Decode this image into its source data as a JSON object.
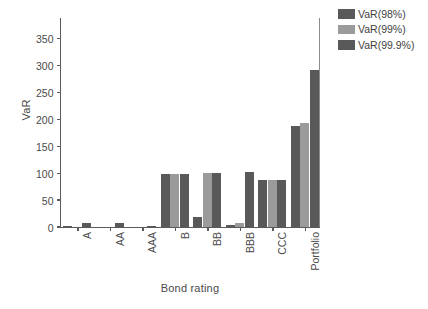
{
  "chart_data": {
    "type": "bar",
    "title": "",
    "xlabel": "Bond rating",
    "ylabel": "VaR",
    "categories": [
      "A",
      "AA",
      "AAA",
      "B",
      "BB",
      "BBB",
      "CCC",
      "Portfolio"
    ],
    "ylim": [
      0,
      390
    ],
    "yticks": [
      0,
      50,
      100,
      150,
      200,
      250,
      300,
      350
    ],
    "grid": false,
    "legend_position": "top-right-outside",
    "series": [
      {
        "name": "VaR(98%)",
        "color": "#595959",
        "values": [
          2,
          0,
          0,
          99,
          18,
          4,
          87,
          188
        ]
      },
      {
        "name": "VaR(99%)",
        "color": "#9b9b9b",
        "values": [
          0,
          0,
          0,
          99,
          100,
          7,
          87,
          194
        ]
      },
      {
        "name": "VaR(99.9%)",
        "color": "#595959",
        "values": [
          8,
          8,
          2,
          99,
          100,
          102,
          87,
          291
        ]
      }
    ]
  },
  "legend": {
    "items": [
      {
        "label": "VaR(98%)"
      },
      {
        "label": "VaR(99%)"
      },
      {
        "label": "VaR(99.9%)"
      }
    ]
  },
  "axes": {
    "y_title": "VaR",
    "x_title": "Bond rating",
    "y_tick_labels": [
      "0",
      "50",
      "100",
      "150",
      "200",
      "250",
      "300",
      "350"
    ],
    "x_tick_labels": [
      "A",
      "AA",
      "AAA",
      "B",
      "BB",
      "BBB",
      "CCC",
      "Portfolio"
    ]
  }
}
